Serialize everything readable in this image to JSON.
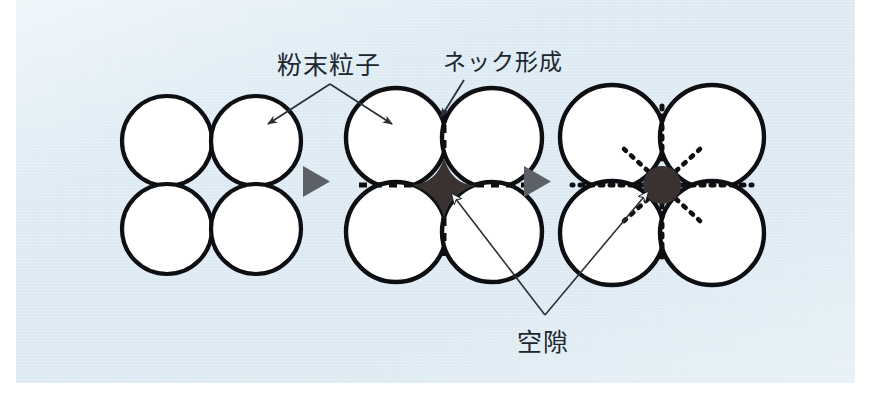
{
  "figure": {
    "title_labels": {
      "powder_particle": "粉末粒子",
      "neck_formation": "ネック形成",
      "void": "空隙"
    },
    "colors": {
      "panel_background": "#dde9f2",
      "panel_background_light": "#eef6fa",
      "particle_outline": "#0d0f12",
      "particle_fill": "#ffffff",
      "void_fill": "#3a3230",
      "stage_arrow": "#5b6167",
      "label_text": "#20262e",
      "leader_line": "#2b3138"
    },
    "stages": [
      {
        "id": "stage-1",
        "name": "loose-powder-particles",
        "particle_count": 4,
        "arrangement": "2x2",
        "particle_radius": 45,
        "has_necks": false,
        "void_shape": "none",
        "centers": [
          [
            167,
            141
          ],
          [
            256,
            141
          ],
          [
            167,
            229
          ],
          [
            256,
            229
          ]
        ]
      },
      {
        "id": "stage-2",
        "name": "neck-formation-with-angular-void",
        "particle_count": 4,
        "arrangement": "2x2",
        "particle_radius": 50,
        "has_necks": true,
        "neck_style": "dashed",
        "void_shape": "concave-diamond",
        "centers": [
          [
            396,
            138
          ],
          [
            492,
            138
          ],
          [
            396,
            232
          ],
          [
            492,
            232
          ]
        ]
      },
      {
        "id": "stage-3",
        "name": "densified-with-rounded-pore",
        "particle_count": 4,
        "arrangement": "2x2",
        "particle_radius": 52,
        "has_necks": true,
        "neck_style": "dotted",
        "void_shape": "circle",
        "void_radius": 19,
        "centers": [
          [
            612,
            137
          ],
          [
            712,
            137
          ],
          [
            612,
            233
          ],
          [
            712,
            233
          ]
        ]
      }
    ],
    "stage_arrows": [
      {
        "name": "stage-arrow-1",
        "x": 313,
        "y": 181,
        "direction": "right"
      },
      {
        "name": "stage-arrow-2",
        "x": 534,
        "y": 181,
        "direction": "right"
      }
    ],
    "annotations": [
      {
        "name": "powder-particle-annotation",
        "label": "粉末粒子",
        "label_x": 277,
        "label_y": 45,
        "leaders": [
          {
            "from": [
              330,
              84
            ],
            "to": [
              264,
              126
            ],
            "arrowhead": true
          },
          {
            "from": [
              330,
              84
            ],
            "to": [
              396,
              126
            ],
            "arrowhead": true
          }
        ]
      },
      {
        "name": "neck-formation-annotation",
        "label": "ネック形成",
        "label_x": 443,
        "label_y": 43,
        "leaders": [
          {
            "from": [
              462,
              80
            ],
            "to": [
              440,
              120
            ],
            "arrowhead": true
          }
        ]
      },
      {
        "name": "void-annotation",
        "label": "空隙",
        "label_x": 517,
        "label_y": 322,
        "leaders": [
          {
            "from": [
              545,
              315
            ],
            "to": [
              447,
              190
            ],
            "arrowhead": true
          },
          {
            "from": [
              545,
              315
            ],
            "to": [
              651,
              188
            ],
            "arrowhead": true
          }
        ]
      }
    ]
  }
}
